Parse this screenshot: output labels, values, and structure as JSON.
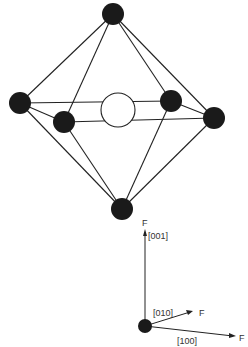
{
  "diagram": {
    "type": "octahedral-coordination",
    "atoms": {
      "top": {
        "x": 113,
        "y": 14,
        "r": 11
      },
      "left": {
        "x": 20,
        "y": 103,
        "r": 11
      },
      "front_left": {
        "x": 64,
        "y": 122,
        "r": 11
      },
      "back_right": {
        "x": 171,
        "y": 101,
        "r": 11
      },
      "right": {
        "x": 214,
        "y": 118,
        "r": 11
      },
      "bottom": {
        "x": 122,
        "y": 209,
        "r": 11
      },
      "center": {
        "x": 118,
        "y": 110,
        "r": 17
      }
    },
    "axes": {
      "origin": {
        "x": 145,
        "y": 326
      },
      "labels": {
        "z_force": "F",
        "z_dir": "[001]",
        "y_force": "F",
        "y_dir": "[010]",
        "x_force": "F",
        "x_dir": "[100]"
      }
    },
    "colors": {
      "atom": "#1a1a1a",
      "line": "#222222",
      "hollow": "#ffffff"
    }
  }
}
